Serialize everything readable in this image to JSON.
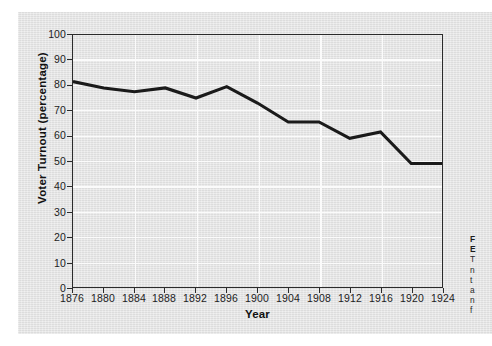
{
  "figure": {
    "panel_background": "#e4e4e4",
    "page_background": "#ffffff"
  },
  "chart_data": {
    "type": "line",
    "title": "",
    "xlabel": "Year",
    "ylabel": "Voter Turnout (percentage)",
    "x": [
      1876,
      1880,
      1884,
      1888,
      1892,
      1896,
      1900,
      1904,
      1908,
      1912,
      1916,
      1920,
      1924
    ],
    "values": [
      81.5,
      79.0,
      77.5,
      79.0,
      75.0,
      79.5,
      73.0,
      65.5,
      65.5,
      59.0,
      61.5,
      49.0,
      49.0
    ],
    "series": [
      {
        "name": "Voter Turnout",
        "values": [
          81.5,
          79.0,
          77.5,
          79.0,
          75.0,
          79.5,
          73.0,
          65.5,
          65.5,
          59.0,
          61.5,
          49.0,
          49.0
        ]
      }
    ],
    "categories": [
      "1876",
      "1880",
      "1884",
      "1888",
      "1892",
      "1896",
      "1900",
      "1904",
      "1908",
      "1912",
      "1916",
      "1920",
      "1924"
    ],
    "xlim": [
      1876,
      1924
    ],
    "ylim": [
      0,
      100
    ],
    "ytick_labels": [
      "100",
      "90",
      "80",
      "70",
      "60",
      "50",
      "40",
      "30",
      "20",
      "10",
      "0"
    ],
    "ytick_values": [
      100,
      90,
      80,
      70,
      60,
      50,
      40,
      30,
      20,
      10,
      0
    ],
    "xtick_labels": [
      "1876",
      "1880",
      "1884",
      "1888",
      "1892",
      "1896",
      "1900",
      "1904",
      "1908",
      "1912",
      "1916",
      "1920",
      "1924"
    ],
    "grid": true,
    "grid_color": "#fbfbfb",
    "legend": "none",
    "line_color": "#1a1a1a",
    "plot_background": "#e0e0e0"
  },
  "caption": {
    "heading_line_1": "F",
    "heading_line_2": "E",
    "body_line_1": "T",
    "body_line_2": "n",
    "body_line_3": "t",
    "body_line_4": "a",
    "body_line_5": "n",
    "body_line_6": "f"
  }
}
